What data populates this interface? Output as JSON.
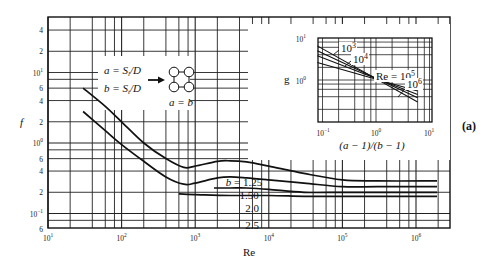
{
  "panel_label": "(a)",
  "chart_data": {
    "type": "line",
    "xscale": "log",
    "yscale": "log",
    "xlabel": "Re",
    "ylabel": "f",
    "xlim": [
      10,
      2000000
    ],
    "ylim": [
      0.06,
      5
    ],
    "grid": true,
    "x_tick_labels": [
      "10^1",
      "10^2",
      "10^3",
      "10^4",
      "10^5",
      "10^6"
    ],
    "y_tick_labels": [
      "4",
      "2",
      "10^1",
      "6",
      "4",
      "2",
      "10^0",
      "6",
      "4",
      "2",
      "10^-1",
      "6"
    ],
    "legend_box": {
      "lines": [
        "a = S_l/D",
        "b = S_t/D"
      ],
      "note": "a = b",
      "diagram": "in-line square tube array"
    },
    "series": [
      {
        "name": "b = 1.25",
        "label": "b = 1.25",
        "x": [
          30,
          60,
          100,
          200,
          400,
          700,
          1000,
          2000,
          3000,
          5000,
          10000,
          30000,
          100000,
          300000,
          2000000
        ],
        "y": [
          6.0,
          3.3,
          2.0,
          1.0,
          0.6,
          0.45,
          0.47,
          0.55,
          0.56,
          0.54,
          0.47,
          0.37,
          0.3,
          0.29,
          0.29
        ]
      },
      {
        "name": "b = 1.50",
        "label": "1.50",
        "x": [
          30,
          60,
          100,
          200,
          400,
          700,
          1000,
          2000,
          3000,
          5000,
          10000,
          30000,
          100000,
          300000,
          2000000
        ],
        "y": [
          2.8,
          1.5,
          0.95,
          0.55,
          0.33,
          0.26,
          0.27,
          0.32,
          0.33,
          0.32,
          0.3,
          0.27,
          0.24,
          0.24,
          0.24
        ]
      },
      {
        "name": "b = 2.0",
        "label": "2.0",
        "x": [
          1800,
          3000,
          5000,
          10000,
          30000,
          100000,
          300000,
          2000000
        ],
        "y": [
          0.23,
          0.23,
          0.23,
          0.22,
          0.2,
          0.2,
          0.2,
          0.2
        ]
      },
      {
        "name": "b = 2.5",
        "label": "2.5",
        "x": [
          600,
          1000,
          3000,
          10000,
          30000,
          100000,
          300000,
          2000000
        ],
        "y": [
          0.19,
          0.185,
          0.18,
          0.18,
          0.175,
          0.175,
          0.175,
          0.175
        ]
      }
    ],
    "inset": {
      "type": "line",
      "xscale": "log",
      "yscale": "log",
      "xlabel": "(a − 1)/(b − 1)",
      "ylabel": "g",
      "xlim": [
        0.07,
        10
      ],
      "ylim": [
        0.15,
        10
      ],
      "x_tick_labels": [
        "10^-1",
        "10^0",
        "10^1"
      ],
      "y_tick_labels": [
        "10^1",
        "10^0"
      ],
      "series": [
        {
          "name": "Re = 10^3",
          "label": "10^3",
          "x": [
            0.08,
            6
          ],
          "y": [
            6.5,
            0.3
          ]
        },
        {
          "name": "Re = 10^4",
          "label": "10^4",
          "x": [
            0.08,
            6
          ],
          "y": [
            5.0,
            0.38
          ]
        },
        {
          "name": "Re = 10^5",
          "label": "Re = 10^5",
          "x": [
            0.08,
            6
          ],
          "y": [
            3.8,
            0.45
          ]
        },
        {
          "name": "Re = 10^6",
          "label": "10^6",
          "x": [
            0.08,
            6
          ],
          "y": [
            2.6,
            0.55
          ]
        }
      ]
    }
  }
}
